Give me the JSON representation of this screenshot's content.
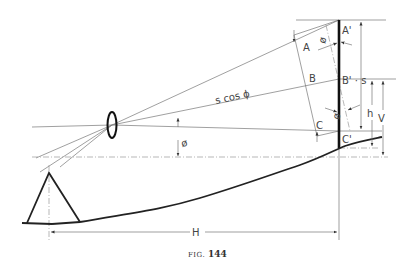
{
  "figure": {
    "caption_prefix": "FIG.",
    "caption_number": "144"
  },
  "labels": {
    "A": "A",
    "B": "B",
    "C": "C",
    "A_prime": "A'",
    "B_prime": "B' · s",
    "C_prime": "C'",
    "s_cos_phi": "s cos ϕ",
    "phi_top": "ø",
    "phi_bottom": "ø",
    "phi_center": "ø",
    "h": "h",
    "V": "V",
    "H": "H"
  }
}
